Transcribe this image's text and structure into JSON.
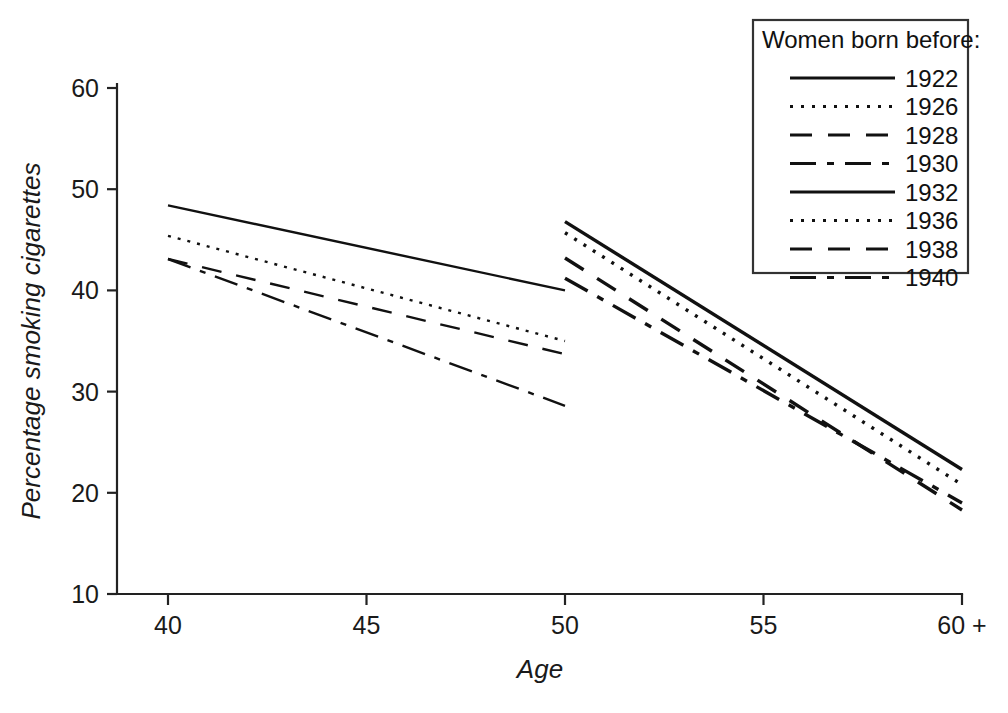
{
  "chart_data": {
    "type": "line",
    "title": "",
    "xlabel": "Age",
    "ylabel": "Percentage smoking cigarettes",
    "xlim": [
      40,
      60
    ],
    "ylim": [
      10,
      60
    ],
    "grid": false,
    "x_tick_labels": [
      "40",
      "45",
      "50",
      "55",
      "60 +"
    ],
    "x_tick_values": [
      40,
      45,
      50,
      55,
      60
    ],
    "y_tick_labels": [
      "10",
      "20",
      "30",
      "40",
      "50",
      "60"
    ],
    "y_tick_values": [
      10,
      20,
      30,
      40,
      50,
      60
    ],
    "legend_title": "Women born before:",
    "legend_position": "top-right",
    "series": [
      {
        "name": "1922",
        "dash": "solid",
        "x": [
          40,
          50
        ],
        "values": [
          48.4,
          40.0
        ]
      },
      {
        "name": "1926",
        "dash": "dotted",
        "x": [
          40,
          50
        ],
        "values": [
          45.4,
          35.0
        ]
      },
      {
        "name": "1928",
        "dash": "dashed",
        "x": [
          40,
          50
        ],
        "values": [
          43.1,
          33.7
        ]
      },
      {
        "name": "1930",
        "dash": "dashdot",
        "x": [
          40,
          50
        ],
        "values": [
          43.1,
          28.6
        ]
      },
      {
        "name": "1932",
        "dash": "solid",
        "x": [
          50,
          60
        ],
        "values": [
          46.8,
          22.3
        ]
      },
      {
        "name": "1936",
        "dash": "dotted",
        "x": [
          50,
          60
        ],
        "values": [
          45.7,
          20.8
        ]
      },
      {
        "name": "1938",
        "dash": "dashed",
        "x": [
          50,
          60
        ],
        "values": [
          43.2,
          18.3
        ]
      },
      {
        "name": "1940",
        "dash": "dashdot",
        "x": [
          50,
          60
        ],
        "values": [
          41.2,
          19.0
        ]
      }
    ],
    "legend_entries": [
      {
        "label": "1922",
        "dash": "solid"
      },
      {
        "label": "1926",
        "dash": "dotted"
      },
      {
        "label": "1928",
        "dash": "dashed"
      },
      {
        "label": "1930",
        "dash": "dashdot"
      },
      {
        "label": "1932",
        "dash": "solid"
      },
      {
        "label": "1936",
        "dash": "dotted"
      },
      {
        "label": "1938",
        "dash": "dashed"
      },
      {
        "label": "1940",
        "dash": "dashdot"
      }
    ],
    "line_color": "#111111"
  }
}
